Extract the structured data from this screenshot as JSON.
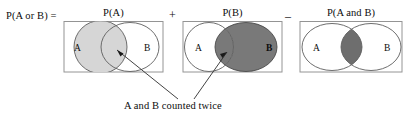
{
  "figure": {
    "caption_equation": "P(A or B) = P(A) + P(B) - P(A and B)",
    "lhs_label": "P(A or B)  =",
    "operators": {
      "plus": "+",
      "minus": "–"
    },
    "annotation": {
      "text": "A and B counted twice"
    },
    "colors": {
      "outline": "#4d4d4d",
      "box_border": "#808080",
      "circle_stroke": "#595959",
      "shade_light": "#d4d4d4",
      "shade_dark": "#787878",
      "text": "#0d0d0d",
      "background": "#ffffff",
      "leader_line": "#3a3a3a"
    },
    "panels": [
      {
        "id": "panel-p-a",
        "label": "P(A)",
        "circle_a": {
          "label": "A",
          "fill": "shade_light"
        },
        "circle_b": {
          "label": "B",
          "fill": "none"
        },
        "intersection_fill": "shade_light"
      },
      {
        "id": "panel-p-b",
        "label": "P(B)",
        "circle_a": {
          "label": "A",
          "fill": "none"
        },
        "circle_b": {
          "label": "B",
          "fill": "shade_dark"
        },
        "intersection_fill": "shade_dark"
      },
      {
        "id": "panel-p-a-and-b",
        "label": "P(A and B)",
        "circle_a": {
          "label": "A",
          "fill": "none"
        },
        "circle_b": {
          "label": "B",
          "fill": "none"
        },
        "intersection_fill": "shade_dark"
      }
    ]
  }
}
